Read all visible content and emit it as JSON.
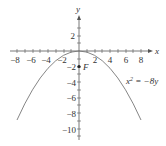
{
  "diagram": {
    "equation": "x² = −8y",
    "equation_parts": {
      "base": "x",
      "exp": "2",
      "rhs": " = −8y"
    },
    "axes": {
      "x_label": "x",
      "y_label": "y"
    },
    "x_ticks": [
      "−8",
      "−6",
      "−4",
      "−2",
      "2",
      "4",
      "6",
      "8"
    ],
    "y_ticks": [
      "2",
      "−2",
      "−4",
      "−6",
      "−8",
      "−10"
    ],
    "focus": {
      "label": "F",
      "x": 0,
      "y": -2
    },
    "x_range": [
      -9,
      9
    ],
    "y_range": [
      -11,
      4
    ],
    "colors": {
      "curve": "#777777",
      "axis": "#555555",
      "text": "#333333"
    }
  }
}
